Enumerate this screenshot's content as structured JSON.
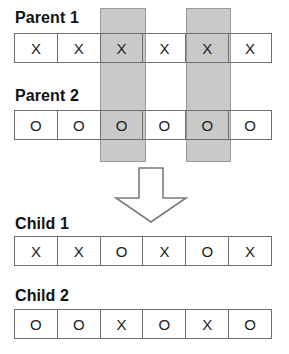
{
  "diagram": {
    "cell_count": 6,
    "colors": {
      "shade": "#c9c9c9",
      "shade_border": "#9a9a9a",
      "cell_border": "#6e6e6e",
      "text": "#1d1d1d",
      "background": "#ffffff"
    },
    "crossover_columns": [
      2,
      4
    ],
    "rows": [
      {
        "id": "parent-1",
        "label": "Parent 1",
        "cells": [
          "X",
          "X",
          "X",
          "X",
          "X",
          "X"
        ]
      },
      {
        "id": "parent-2",
        "label": "Parent 2",
        "cells": [
          "O",
          "O",
          "O",
          "O",
          "O",
          "O"
        ]
      },
      {
        "id": "child-1",
        "label": "Child 1",
        "cells": [
          "X",
          "X",
          "O",
          "X",
          "O",
          "X"
        ]
      },
      {
        "id": "child-2",
        "label": "Child 2",
        "cells": [
          "O",
          "O",
          "X",
          "O",
          "X",
          "O"
        ]
      }
    ],
    "arrow": {
      "name": "down-arrow",
      "direction": "down"
    }
  }
}
